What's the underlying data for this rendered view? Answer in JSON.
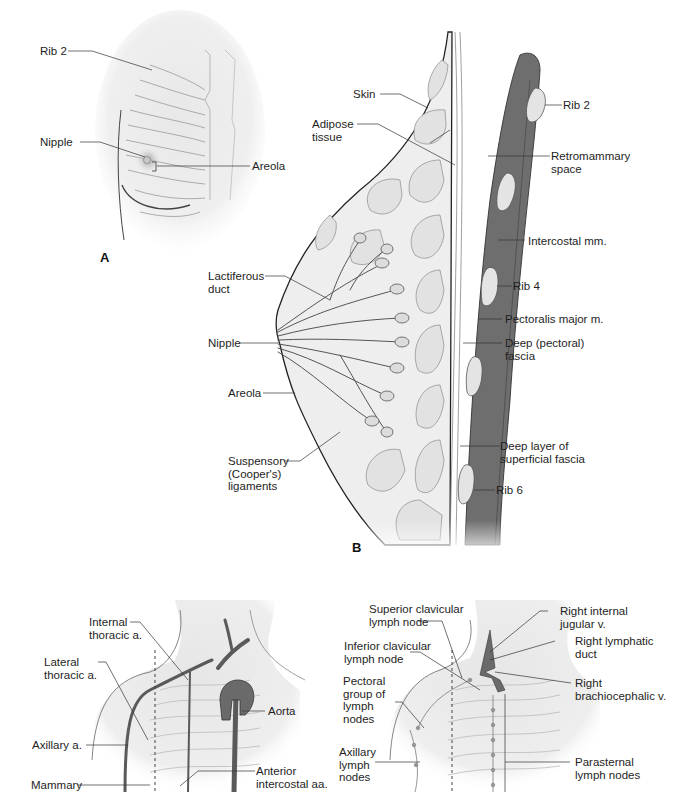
{
  "figure": {
    "panels": [
      {
        "id": "A",
        "letter": "A",
        "description": "Anterior view of female breast over rib cage",
        "labels": {
          "rib2": "Rib 2",
          "nipple": "Nipple",
          "areola": "Areola"
        }
      },
      {
        "id": "B",
        "letter": "B",
        "description": "Sagittal section of breast",
        "labels": {
          "skin": "Skin",
          "adipose": "Adipose\ntissue",
          "rib2": "Rib 2",
          "retromammary": "Retromammary\nspace",
          "intercostal": "Intercostal mm.",
          "lactiferous": "Lactiferous\nduct",
          "rib4": "Rib 4",
          "pectoralis": "Pectoralis major m.",
          "nipple": "Nipple",
          "deep_fascia": "Deep (pectoral)\nfascia",
          "areola": "Areola",
          "superficial_fascia": "Deep layer of\nsuperficial fascia",
          "suspensory": "Suspensory\n(Cooper's)\nligaments",
          "rib6": "Rib 6"
        }
      },
      {
        "id": "C",
        "description": "Arterial supply of breast",
        "labels": {
          "internal_thoracic": "Internal\nthoracic a.",
          "lateral_thoracic": "Lateral\nthoracic a.",
          "aorta": "Aorta",
          "axillary": "Axillary a.",
          "anterior_intercostal": "Anterior\nintercostal aa.",
          "mammary": "Mammary"
        }
      },
      {
        "id": "D",
        "description": "Lymphatic drainage of breast",
        "labels": {
          "superior_clavicular": "Superior clavicular\nlymph node",
          "right_internal_jugular": "Right internal\njugular v.",
          "inferior_clavicular": "Inferior clavicular\nlymph node",
          "right_lymphatic": "Right lymphatic\nduct",
          "pectoral_group": "Pectoral\ngroup of\nlymph\nnodes",
          "right_brachiocephalic": "Right\nbrachiocephalic v.",
          "axillary_nodes": "Axillary\nlymph\nnodes",
          "parasternal": "Parasternal\nlymph nodes"
        }
      }
    ],
    "colors": {
      "muscle": "#6e6e6e",
      "rib": "#e4e4e4",
      "tissue": "#eeeeee",
      "duct": "#cfcfcf",
      "vessel": "#5a5a5a",
      "leader": "#333333"
    }
  }
}
